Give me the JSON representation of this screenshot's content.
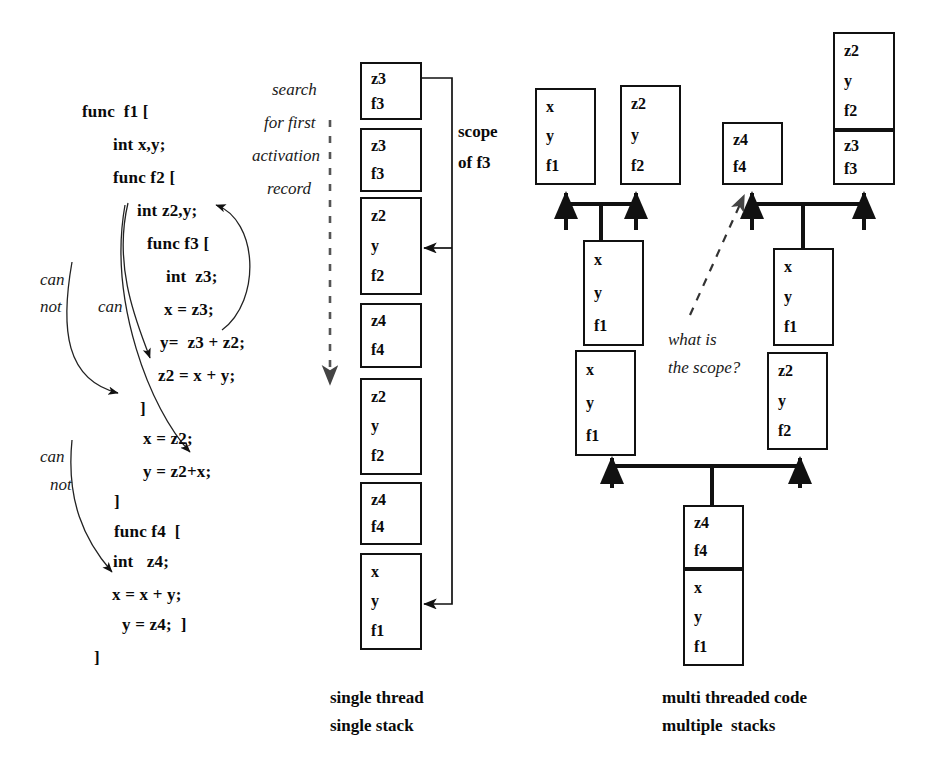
{
  "code": {
    "lines": [
      {
        "text": "func  f1 [",
        "x": 82,
        "y": 102
      },
      {
        "text": "int x,y;",
        "x": 113,
        "y": 135
      },
      {
        "text": "func f2 [",
        "x": 113,
        "y": 168
      },
      {
        "text": "int z2,y;",
        "x": 137,
        "y": 201
      },
      {
        "text": "func f3 [",
        "x": 147,
        "y": 234
      },
      {
        "text": "int  z3;",
        "x": 166,
        "y": 267
      },
      {
        "text": "x = z3;",
        "x": 164,
        "y": 300
      },
      {
        "text": "y=  z3 + z2;",
        "x": 160,
        "y": 333
      },
      {
        "text": "z2 = x + y;",
        "x": 158,
        "y": 366
      },
      {
        "text": "]",
        "x": 140,
        "y": 399
      },
      {
        "text": "x = z2;",
        "x": 143,
        "y": 429
      },
      {
        "text": "y = z2+x;",
        "x": 143,
        "y": 462
      },
      {
        "text": "]",
        "x": 114,
        "y": 492
      },
      {
        "text": "func f4  [",
        "x": 114,
        "y": 522
      },
      {
        "text": "int   z4;",
        "x": 113,
        "y": 552
      },
      {
        "text": "x = x + y;",
        "x": 112,
        "y": 585
      },
      {
        "text": "y = z4;  ]",
        "x": 122,
        "y": 615
      },
      {
        "text": "]",
        "x": 94,
        "y": 648
      }
    ],
    "annotations": [
      {
        "name": "can-label-1",
        "text": "can",
        "x": 40,
        "y": 270
      },
      {
        "name": "not-label-1",
        "text": "not",
        "x": 40,
        "y": 297
      },
      {
        "name": "can-label-2",
        "text": "can",
        "x": 98,
        "y": 297
      },
      {
        "name": "can-label-3",
        "text": "can",
        "x": 40,
        "y": 447
      },
      {
        "name": "not-label-2",
        "text": "not",
        "x": 50,
        "y": 475
      }
    ]
  },
  "single_stack": {
    "search_label": [
      {
        "name": "search-line-1",
        "text": "search",
        "x": 272,
        "y": 80
      },
      {
        "name": "search-line-2",
        "text": "for first",
        "x": 264,
        "y": 113
      },
      {
        "name": "search-line-3",
        "text": "activation",
        "x": 252,
        "y": 146
      },
      {
        "name": "search-line-4",
        "text": "record",
        "x": 267,
        "y": 179
      }
    ],
    "scope_label": {
      "line1": "scope",
      "line2": "of f3",
      "x": 458,
      "y": 122
    },
    "caption": {
      "line1": "single thread",
      "line2": "single stack",
      "x": 330,
      "y": 688
    },
    "frames": [
      {
        "name": "frame-f3-top",
        "slots": [
          "z3",
          "f3"
        ],
        "x": 360,
        "y": 62,
        "w": 62,
        "h": 58
      },
      {
        "name": "frame-f3-second",
        "slots": [
          "z3",
          "f3"
        ],
        "x": 360,
        "y": 128,
        "w": 62,
        "h": 64
      },
      {
        "name": "frame-f2-upper",
        "slots": [
          "z2",
          "y",
          "f2"
        ],
        "x": 360,
        "y": 197,
        "w": 62,
        "h": 98
      },
      {
        "name": "frame-f4-upper",
        "slots": [
          "z4",
          "f4"
        ],
        "x": 360,
        "y": 303,
        "w": 62,
        "h": 65
      },
      {
        "name": "frame-f2-lower",
        "slots": [
          "z2",
          "y",
          "f2"
        ],
        "x": 360,
        "y": 378,
        "w": 62,
        "h": 97
      },
      {
        "name": "frame-f4-lower",
        "slots": [
          "z4",
          "f4"
        ],
        "x": 360,
        "y": 482,
        "w": 62,
        "h": 63
      },
      {
        "name": "frame-f1-bottom",
        "slots": [
          "x",
          "y",
          "f1"
        ],
        "x": 360,
        "y": 553,
        "w": 62,
        "h": 97
      }
    ]
  },
  "multi_stack": {
    "question_label": {
      "line1": "what is",
      "line2": "the scope?",
      "x": 668,
      "y": 330
    },
    "caption": {
      "line1": "multi threaded code",
      "line2": "multiple  stacks",
      "x": 662,
      "y": 688
    },
    "frames": [
      {
        "name": "frame-t1-f1",
        "slots": [
          "x",
          "y",
          "f1"
        ],
        "x": 535,
        "y": 88,
        "w": 61,
        "h": 97
      },
      {
        "name": "frame-t1-f2",
        "slots": [
          "z2",
          "y",
          "f2"
        ],
        "x": 620,
        "y": 85,
        "w": 61,
        "h": 100
      },
      {
        "name": "frame-t2-f4",
        "slots": [
          "z4",
          "f4"
        ],
        "x": 722,
        "y": 122,
        "w": 61,
        "h": 63
      },
      {
        "name": "frame-t3-f2",
        "slots": [
          "z2",
          "y",
          "f2"
        ],
        "x": 833,
        "y": 32,
        "w": 62,
        "h": 98
      },
      {
        "name": "frame-t3-f3",
        "slots": [
          "z3",
          "f3"
        ],
        "x": 833,
        "y": 130,
        "w": 62,
        "h": 55
      },
      {
        "name": "frame-left-f1-up",
        "slots": [
          "x",
          "y",
          "f1"
        ],
        "x": 583,
        "y": 240,
        "w": 61,
        "h": 106
      },
      {
        "name": "frame-left-f1-low",
        "slots": [
          "x",
          "y",
          "f1"
        ],
        "x": 575,
        "y": 350,
        "w": 61,
        "h": 106
      },
      {
        "name": "frame-right-f1",
        "slots": [
          "x",
          "y",
          "f1"
        ],
        "x": 773,
        "y": 248,
        "w": 61,
        "h": 98
      },
      {
        "name": "frame-right-f2",
        "slots": [
          "z2",
          "y",
          "f2"
        ],
        "x": 767,
        "y": 352,
        "w": 61,
        "h": 98
      },
      {
        "name": "frame-base-f4",
        "slots": [
          "z4",
          "f4"
        ],
        "x": 683,
        "y": 505,
        "w": 61,
        "h": 64
      },
      {
        "name": "frame-base-f1",
        "slots": [
          "x",
          "y",
          "f1"
        ],
        "x": 683,
        "y": 569,
        "w": 61,
        "h": 97
      }
    ]
  },
  "colors": {
    "ink": "#0a0a0a",
    "line": "#111111",
    "background": "#ffffff"
  }
}
